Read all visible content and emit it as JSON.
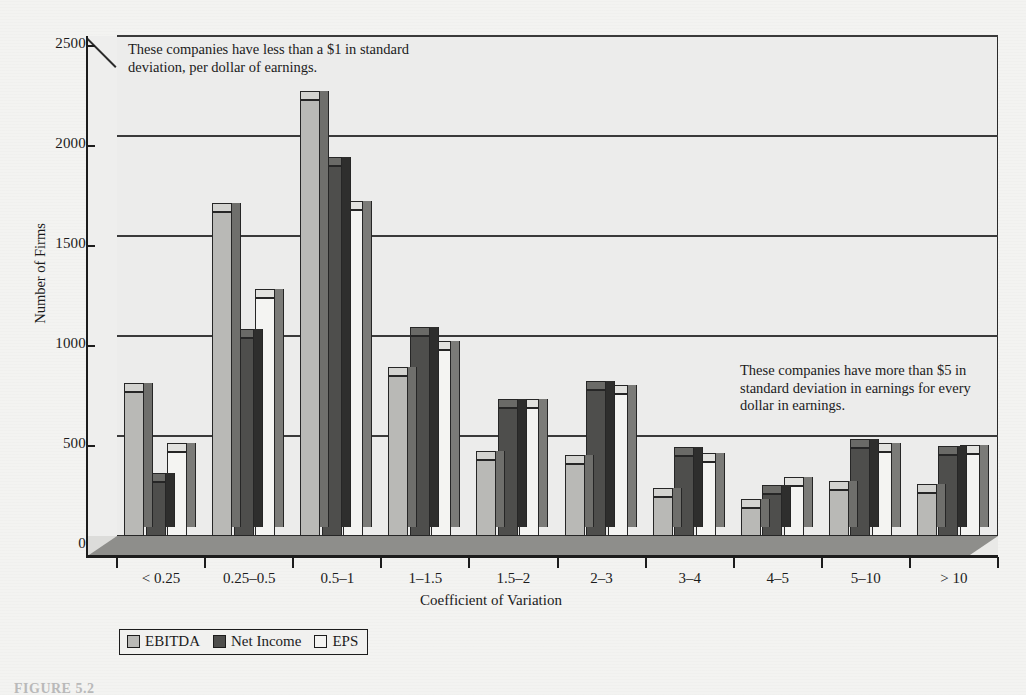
{
  "figure": {
    "caption": "FIGURE 5.2"
  },
  "chart_data": {
    "type": "bar",
    "title": "",
    "xlabel": "Coefficient of Variation",
    "ylabel": "Number of Firms",
    "ylim": [
      0,
      2500
    ],
    "yticks": [
      0,
      500,
      1000,
      1500,
      2000,
      2500
    ],
    "ytick_labels": [
      "0",
      "500",
      "1000",
      "1500",
      "2000",
      "2500"
    ],
    "grid": true,
    "legend_position": "bottom-left",
    "style": "3d-clustered-column",
    "categories": [
      "< 0.25",
      "0.25–0.5",
      "0.5–1",
      "1–1.5",
      "1.5–2",
      "2–3",
      "3–4",
      "4–5",
      "5–10",
      "> 10"
    ],
    "series": [
      {
        "name": "EBITDA",
        "color": "#b9b9b6",
        "values": [
          720,
          1620,
          2180,
          800,
          380,
          360,
          195,
          140,
          230,
          215
        ]
      },
      {
        "name": "Net Income",
        "color": "#4e4e4c",
        "values": [
          270,
          990,
          1850,
          1000,
          640,
          730,
          400,
          210,
          440,
          405
        ]
      },
      {
        "name": "EPS",
        "color": "#f4f4f2",
        "values": [
          420,
          1190,
          1630,
          930,
          640,
          710,
          370,
          250,
          420,
          410
        ]
      }
    ],
    "annotations": [
      {
        "id": "left",
        "text": "These companies have less than a $1 in standard deviation, per dollar of earnings."
      },
      {
        "id": "right",
        "text": "These companies have more than $5 in standard deviation in earnings for every dollar in earnings."
      }
    ]
  }
}
